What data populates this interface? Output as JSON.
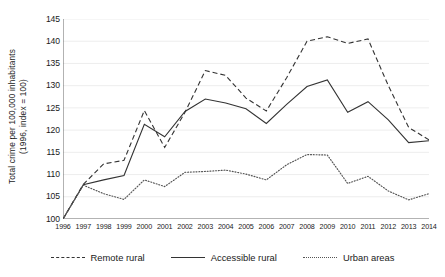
{
  "chart_data": {
    "type": "line",
    "title": "",
    "xlabel": "",
    "ylabel": "Total crime per 100,000 inhabitants",
    "ylabel_line2": "(1996, index = 100)",
    "x": [
      1996,
      1997,
      1998,
      1999,
      2000,
      2001,
      2002,
      2003,
      2004,
      2005,
      2006,
      2007,
      2008,
      2009,
      2010,
      2011,
      2012,
      2013,
      2014
    ],
    "categories": [
      "1996",
      "1997",
      "1998",
      "1999",
      "2000",
      "2001",
      "2002",
      "2003",
      "2004",
      "2005",
      "2006",
      "2007",
      "2008",
      "2009",
      "2010",
      "2011",
      "2012",
      "2013",
      "2014"
    ],
    "xlim": [
      1996,
      2014
    ],
    "ylim": [
      100,
      145
    ],
    "yticks": [
      100,
      105,
      110,
      115,
      120,
      125,
      130,
      135,
      140,
      145
    ],
    "grid": true,
    "legend_position": "bottom",
    "series": [
      {
        "name": "Remote rural",
        "style": "dashed",
        "color": "#333333",
        "values": [
          100.0,
          107.8,
          112.4,
          113.2,
          124.4,
          116.1,
          124.0,
          133.4,
          132.3,
          127.2,
          124.3,
          131.8,
          140.0,
          141.0,
          139.5,
          140.5,
          130.0,
          120.6,
          117.8
        ]
      },
      {
        "name": "Accessible rural",
        "style": "solid",
        "color": "#333333",
        "values": [
          100.0,
          107.7,
          108.8,
          109.8,
          121.3,
          118.5,
          124.2,
          127.0,
          126.1,
          124.8,
          121.5,
          125.8,
          129.8,
          131.3,
          124.0,
          126.4,
          122.3,
          117.2,
          117.6
        ]
      },
      {
        "name": "Urban areas",
        "style": "dotted",
        "color": "#555555",
        "values": [
          100.0,
          107.6,
          105.7,
          104.4,
          108.8,
          107.3,
          110.5,
          110.7,
          111.0,
          110.1,
          108.8,
          112.2,
          114.5,
          114.4,
          108.0,
          109.6,
          106.3,
          104.3,
          105.7
        ]
      }
    ]
  }
}
